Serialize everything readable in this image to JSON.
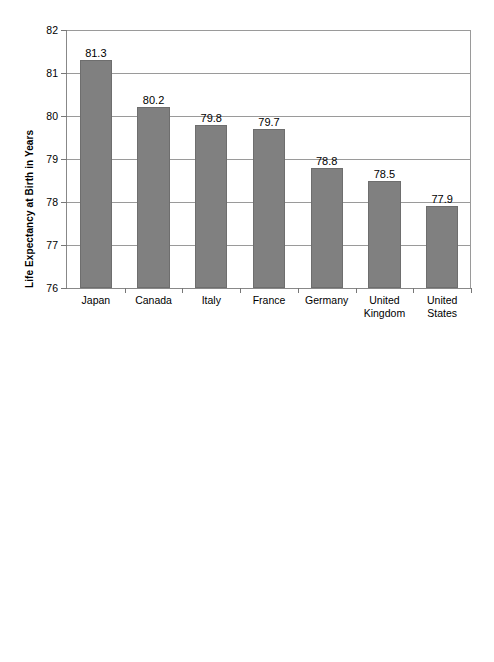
{
  "chart_data": [
    {
      "id": "life-expectancy",
      "type": "bar",
      "title": "",
      "xlabel": "",
      "ylabel": "Life Expectancy at Birth in Years",
      "ylim": [
        76,
        82
      ],
      "yticks": [
        76,
        77,
        78,
        79,
        80,
        81,
        82
      ],
      "ytick_labels": [
        "76",
        "77",
        "78",
        "79",
        "80",
        "81",
        "82"
      ],
      "grid": true,
      "legend": false,
      "bar_color": "#808080",
      "bar_edge_color": "#6e6e6e",
      "categories": [
        "Japan",
        "Canada",
        "Italy",
        "France",
        "Germany",
        "United Kingdom",
        "United States"
      ],
      "category_lines": [
        [
          "Japan"
        ],
        [
          "Canada"
        ],
        [
          "Italy"
        ],
        [
          "France"
        ],
        [
          "Germany"
        ],
        [
          "United",
          "Kingdom"
        ],
        [
          "United",
          "States"
        ]
      ],
      "values": [
        81.3,
        80.2,
        79.8,
        79.7,
        78.8,
        78.5,
        77.9
      ],
      "data_labels": [
        "81.3",
        "80.2",
        "79.8",
        "79.7",
        "78.8",
        "78.5",
        "77.9"
      ]
    },
    {
      "id": "infant-deaths",
      "type": "bar",
      "title": "",
      "xlabel": "",
      "ylabel": "Deaths Under 1 Year Divided by Live Births",
      "ylim": [
        0,
        7
      ],
      "yticks": [
        0,
        1,
        2,
        3,
        4,
        5,
        6,
        7
      ],
      "ytick_labels": [
        "0",
        "1",
        "2",
        "3",
        "4",
        "5",
        "6",
        "7"
      ],
      "grid": true,
      "legend": false,
      "bar_color": "#808080",
      "bar_edge_color": "#6e6e6e",
      "categories": [
        "Japan",
        "Germany",
        "France",
        "Canada",
        "United Kingdom",
        "Italy",
        "United States"
      ],
      "category_lines": [
        [
          "Japan"
        ],
        [
          "Germany"
        ],
        [
          "France"
        ],
        [
          "Canada"
        ],
        [
          "United",
          "Kingdom"
        ],
        [
          "Italy"
        ],
        [
          "United",
          "States"
        ]
      ],
      "values": [
        3.2,
        4.1,
        4.2,
        4.7,
        5.1,
        5.8,
        6.4
      ],
      "data_labels": [
        "3.2",
        "4.1",
        "4.2",
        "4.7",
        "5.1",
        "5.8",
        "6.4"
      ]
    }
  ]
}
